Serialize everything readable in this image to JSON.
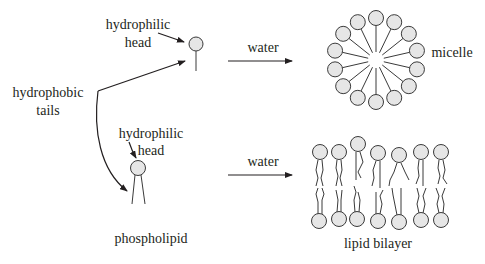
{
  "labels": {
    "top_head_line1": "hydrophilic",
    "top_head_line2": "head",
    "tails_line1": "hydrophobic",
    "tails_line2": "tails",
    "bottom_head_line1": "hydrophilic",
    "bottom_head_line2": "head",
    "phospholipid": "phospholipid",
    "water_top": "water",
    "water_bottom": "water",
    "micelle": "micelle",
    "lipid_bilayer": "lipid bilayer"
  },
  "colors": {
    "head_fill": "#e6e6e6",
    "stroke": "#3a3a3a",
    "text": "#231f20"
  },
  "micelle": {
    "center": [
      376,
      60
    ],
    "radius": 42,
    "head_count": 14,
    "head_radius": 7.5
  },
  "bilayer": {
    "columns": 7
  }
}
